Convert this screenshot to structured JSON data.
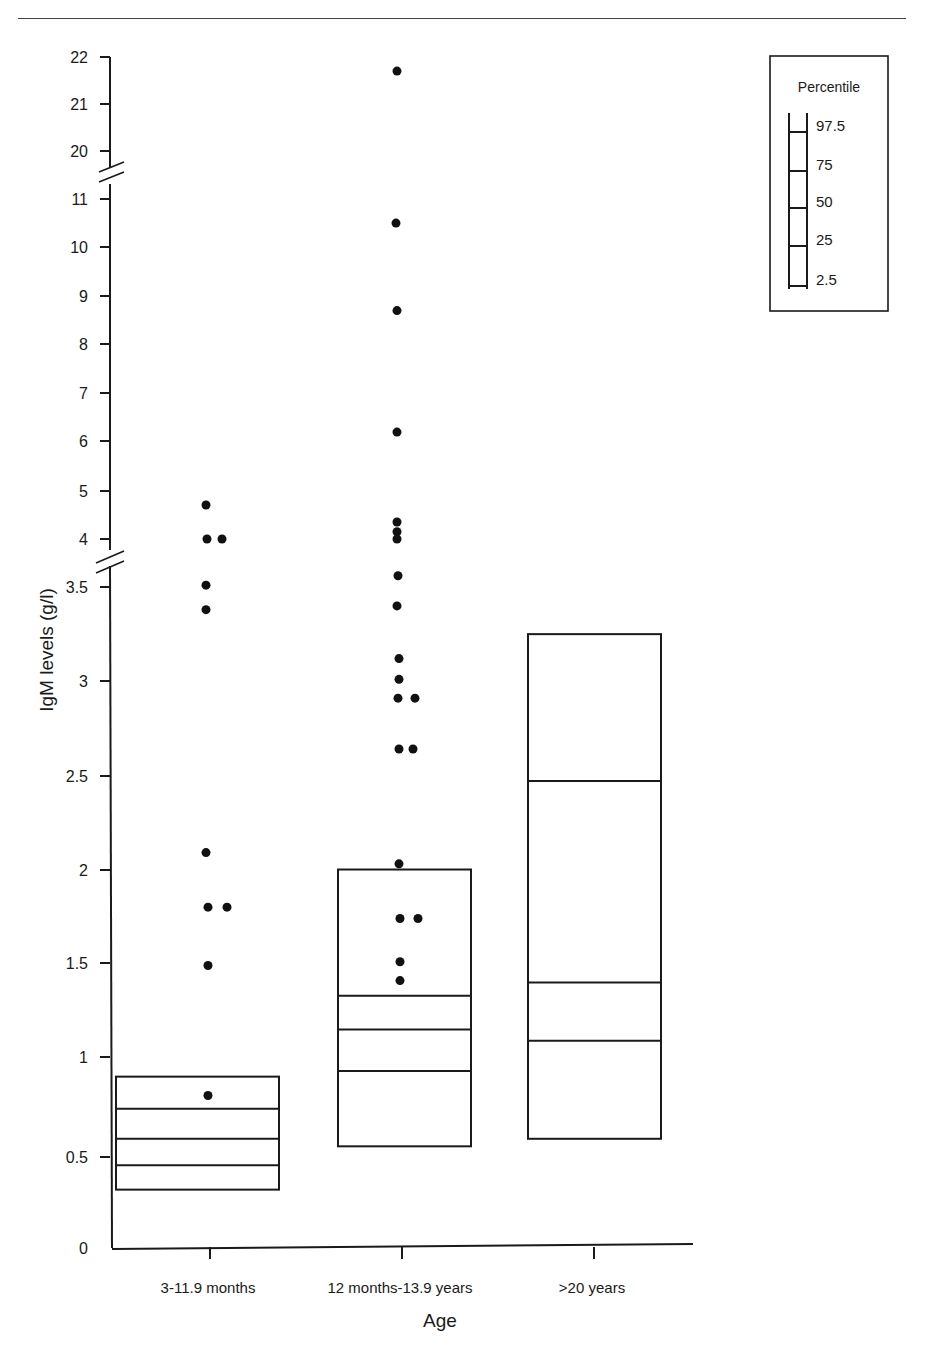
{
  "chart_data": {
    "type": "box",
    "title": "",
    "xlabel": "Age",
    "ylabel": "IgM levels (g/l)",
    "categories": [
      "3-11.9 months",
      "12 months-13.9 years",
      ">20 years"
    ],
    "y_axis": {
      "broken": true,
      "segments": [
        {
          "range": [
            0,
            3.5
          ],
          "ticks": [
            "0",
            "0.5",
            "1",
            "1.5",
            "2",
            "2.5",
            "3",
            "3.5"
          ]
        },
        {
          "range": [
            4,
            11
          ],
          "ticks": [
            "4",
            "5",
            "6",
            "7",
            "8",
            "9",
            "10",
            "11"
          ]
        },
        {
          "range": [
            20,
            22
          ],
          "ticks": [
            "20",
            "21",
            "22"
          ]
        }
      ]
    },
    "legend": {
      "title": "Percentile",
      "entries": [
        "97.5",
        "75",
        "50",
        "25",
        "2.5"
      ],
      "position": "top-right"
    },
    "percentile_boxes": [
      {
        "category": "3-11.9 months",
        "p2_5": 0.31,
        "p25": 0.44,
        "p50": 0.58,
        "p75": 0.74,
        "p97_5": 0.91
      },
      {
        "category": "12 months-13.9 years",
        "p2_5": 0.54,
        "p25": 0.94,
        "p50": 1.16,
        "p75": 1.34,
        "p97_5": 2.01
      },
      {
        "category": ">20 years",
        "p2_5": 0.58,
        "p25": 1.1,
        "p50": 1.41,
        "p75": 2.48,
        "p97_5": 3.26
      }
    ],
    "points": [
      {
        "category": "3-11.9 months",
        "values": [
          4.7,
          4.0,
          4.0,
          3.52,
          3.39,
          2.1,
          1.81,
          1.81,
          1.5,
          0.81
        ]
      },
      {
        "category": "12 months-13.9 years",
        "values": [
          21.7,
          10.5,
          8.7,
          6.2,
          4.35,
          4.15,
          4.0,
          3.57,
          3.41,
          3.13,
          3.02,
          2.92,
          2.92,
          2.65,
          2.65,
          2.04,
          1.75,
          1.75,
          1.52,
          1.42
        ]
      },
      {
        "category": ">20 years",
        "values": []
      }
    ],
    "grid": false
  },
  "axis": {
    "ylabel": "IgM levels (g/l)",
    "xlabel": "Age",
    "y_ticks": [
      {
        "label": "0",
        "y": 1248
      },
      {
        "label": "0.5",
        "y": 1157
      },
      {
        "label": "1",
        "y": 1057
      },
      {
        "label": "1.5",
        "y": 963
      },
      {
        "label": "2",
        "y": 870
      },
      {
        "label": "2.5",
        "y": 776
      },
      {
        "label": "3",
        "y": 681
      },
      {
        "label": "3.5",
        "y": 587
      },
      {
        "label": "4",
        "y": 539
      },
      {
        "label": "5",
        "y": 491
      },
      {
        "label": "6",
        "y": 441
      },
      {
        "label": "7",
        "y": 393
      },
      {
        "label": "8",
        "y": 344
      },
      {
        "label": "9",
        "y": 296
      },
      {
        "label": "10",
        "y": 247
      },
      {
        "label": "11",
        "y": 199
      },
      {
        "label": "20",
        "y": 151
      },
      {
        "label": "21",
        "y": 104
      },
      {
        "label": "22",
        "y": 57
      }
    ],
    "x_categories": [
      {
        "label": "3-11.9 months",
        "x": 210
      },
      {
        "label": "12 months-13.9 years",
        "x": 402
      },
      {
        "label": ">20 years",
        "x": 594
      }
    ]
  },
  "legend": {
    "title": "Percentile",
    "entries": [
      "97.5",
      "75",
      "50",
      "25",
      "2.5"
    ]
  }
}
